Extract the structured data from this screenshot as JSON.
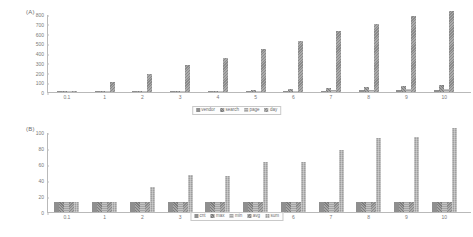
{
  "chart_data": [
    {
      "type": "bar",
      "panel": "(A)",
      "title": "",
      "xlabel": "",
      "ylabel": "",
      "ylim": [
        0,
        800
      ],
      "yticks": [
        0,
        100,
        200,
        300,
        400,
        500,
        600,
        700,
        800
      ],
      "grid": false,
      "legend_position": "bottom",
      "categories": [
        "0.1",
        "1",
        "2",
        "3",
        "4",
        "5",
        "6",
        "7",
        "8",
        "9",
        "10"
      ],
      "series": [
        {
          "name": "vendor",
          "values": [
            1,
            2,
            3,
            5,
            7,
            9,
            11,
            14,
            17,
            20,
            24
          ]
        },
        {
          "name": "search",
          "values": [
            1,
            3,
            5,
            9,
            13,
            20,
            28,
            38,
            48,
            58,
            70
          ]
        },
        {
          "name": "page",
          "values": [
            1,
            2,
            4,
            6,
            8,
            11,
            14,
            18,
            22,
            27,
            33
          ]
        },
        {
          "name": "day",
          "values": [
            13,
            100,
            185,
            272,
            350,
            437,
            520,
            630,
            695,
            780,
            830
          ]
        }
      ]
    },
    {
      "type": "bar",
      "panel": "(B)",
      "title": "",
      "xlabel": "",
      "ylabel": "",
      "ylim": [
        0,
        100
      ],
      "yticks": [
        0,
        20,
        40,
        60,
        80,
        100
      ],
      "grid": false,
      "legend_position": "bottom",
      "categories": [
        "0.1",
        "1",
        "2",
        "3",
        "4",
        "5",
        "6",
        "7",
        "8",
        "9",
        "10"
      ],
      "series": [
        {
          "name": "cnt",
          "values": [
            13,
            13,
            13,
            13,
            13,
            13,
            13,
            13,
            13,
            13,
            13
          ]
        },
        {
          "name": "max",
          "values": [
            13,
            13,
            13,
            13,
            13,
            13,
            13,
            13,
            13,
            13,
            13
          ]
        },
        {
          "name": "min",
          "values": [
            13,
            13,
            13,
            13,
            13,
            13,
            13,
            13,
            13,
            13,
            13
          ]
        },
        {
          "name": "avg",
          "values": [
            13,
            13,
            13,
            13,
            13,
            13,
            13,
            13,
            13,
            13,
            13
          ]
        },
        {
          "name": "sum",
          "values": [
            13,
            13,
            31,
            46,
            45,
            62,
            62,
            78,
            93,
            94,
            105
          ]
        }
      ]
    }
  ]
}
